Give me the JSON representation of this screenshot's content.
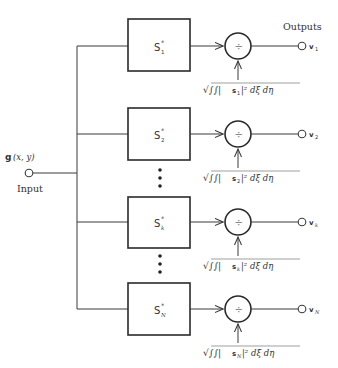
{
  "diagram": {
    "input": {
      "signal_label": "g",
      "signal_args": "(x, y)",
      "caption": "Input"
    },
    "outputs_caption": "Outputs",
    "divide_symbol": "÷",
    "channels": [
      {
        "filter": {
          "name": "S",
          "superscript": "*",
          "subscript": "1"
        },
        "normalizer": {
          "prefix": "√∫∫|",
          "s_label": "s",
          "s_sub": "1",
          "suffix": "|² dξ dη"
        },
        "output": {
          "name": "v",
          "subscript": "1"
        }
      },
      {
        "filter": {
          "name": "S",
          "superscript": "*",
          "subscript": "2"
        },
        "normalizer": {
          "prefix": "√∫∫|",
          "s_label": "s",
          "s_sub": "2",
          "suffix": "|² dξ dη"
        },
        "output": {
          "name": "v",
          "subscript": "2"
        }
      },
      {
        "filter": {
          "name": "S",
          "superscript": "*",
          "subscript": "k"
        },
        "normalizer": {
          "prefix": "√∫∫|",
          "s_label": "s",
          "s_sub": "k",
          "suffix": "|² dξ dη"
        },
        "output": {
          "name": "v",
          "subscript": "k"
        }
      },
      {
        "filter": {
          "name": "S",
          "superscript": "*",
          "subscript": "N"
        },
        "normalizer": {
          "prefix": "√∫∫|",
          "s_label": "s",
          "s_sub": "N",
          "suffix": "|² dξ dη"
        },
        "output": {
          "name": "v",
          "subscript": "N"
        }
      }
    ],
    "ellipsis": "⋮"
  }
}
